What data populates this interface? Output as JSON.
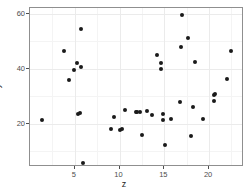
{
  "chart_data": {
    "type": "scatter",
    "title": "",
    "xlabel": "z",
    "ylabel": "y",
    "xlim": [
      0.0,
      23.9
    ],
    "ylim": [
      4.2,
      62.0
    ],
    "xticks": [
      5,
      10,
      15,
      20
    ],
    "yticks": [
      20,
      40,
      60
    ],
    "xtick_labels": [
      "5",
      "10",
      "15",
      "20"
    ],
    "ytick_labels": [
      "20",
      "40",
      "60"
    ],
    "grid": true,
    "legend": "none",
    "point_color": "#1a1a1a",
    "panel_background": "#ffffff",
    "grid_color": "#ebebeb",
    "points": [
      {
        "x": 1.3,
        "y": 21.4
      },
      {
        "x": 3.8,
        "y": 46.4
      },
      {
        "x": 4.4,
        "y": 35.8
      },
      {
        "x": 4.9,
        "y": 39.3
      },
      {
        "x": 5.2,
        "y": 42.1
      },
      {
        "x": 5.4,
        "y": 23.6
      },
      {
        "x": 5.6,
        "y": 23.9
      },
      {
        "x": 5.7,
        "y": 40.7
      },
      {
        "x": 5.7,
        "y": 54.5
      },
      {
        "x": 5.9,
        "y": 5.6
      },
      {
        "x": 9.0,
        "y": 18.1
      },
      {
        "x": 9.4,
        "y": 22.3
      },
      {
        "x": 10.1,
        "y": 17.8
      },
      {
        "x": 10.3,
        "y": 17.9
      },
      {
        "x": 10.6,
        "y": 24.9
      },
      {
        "x": 11.8,
        "y": 24.1
      },
      {
        "x": 12.0,
        "y": 24.2
      },
      {
        "x": 12.3,
        "y": 24.2
      },
      {
        "x": 12.5,
        "y": 15.7
      },
      {
        "x": 13.1,
        "y": 24.5
      },
      {
        "x": 13.6,
        "y": 23.2
      },
      {
        "x": 14.2,
        "y": 45.0
      },
      {
        "x": 14.6,
        "y": 42.0
      },
      {
        "x": 14.6,
        "y": 40.0
      },
      {
        "x": 14.8,
        "y": 23.5
      },
      {
        "x": 14.8,
        "y": 21.2
      },
      {
        "x": 15.1,
        "y": 12.1
      },
      {
        "x": 15.8,
        "y": 21.5
      },
      {
        "x": 16.8,
        "y": 27.9
      },
      {
        "x": 16.9,
        "y": 48.0
      },
      {
        "x": 17.0,
        "y": 59.6
      },
      {
        "x": 17.6,
        "y": 51.0
      },
      {
        "x": 18.0,
        "y": 15.4
      },
      {
        "x": 18.2,
        "y": 26.1
      },
      {
        "x": 18.4,
        "y": 42.3
      },
      {
        "x": 19.3,
        "y": 21.5
      },
      {
        "x": 20.5,
        "y": 28.2
      },
      {
        "x": 20.6,
        "y": 30.4
      },
      {
        "x": 20.7,
        "y": 30.8
      },
      {
        "x": 22.0,
        "y": 36.2
      },
      {
        "x": 22.5,
        "y": 46.4
      }
    ]
  }
}
